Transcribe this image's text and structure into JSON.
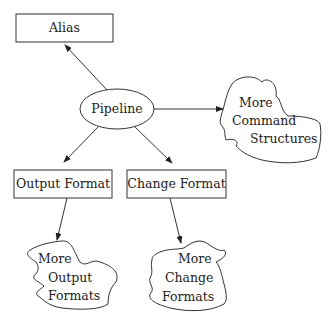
{
  "diagram": {
    "nodes": {
      "alias": {
        "label": "Alias",
        "shape": "rectangle"
      },
      "pipeline": {
        "label": "Pipeline",
        "shape": "ellipse"
      },
      "output_format": {
        "label": "Output Format",
        "shape": "rectangle"
      },
      "change_format": {
        "label": "Change Format",
        "shape": "rectangle"
      },
      "more_command_structures": {
        "lines": [
          "More",
          "Command",
          "Structures"
        ],
        "shape": "cloud"
      },
      "more_output_formats": {
        "lines": [
          "More",
          "Output",
          "Formats"
        ],
        "shape": "cloud"
      },
      "more_change_formats": {
        "lines": [
          "More",
          "Change",
          "Formats"
        ],
        "shape": "cloud"
      }
    },
    "edges": [
      {
        "from": "Pipeline",
        "to": "Alias"
      },
      {
        "from": "Pipeline",
        "to": "More Command Structures"
      },
      {
        "from": "Pipeline",
        "to": "Output Format"
      },
      {
        "from": "Pipeline",
        "to": "Change Format"
      },
      {
        "from": "Output Format",
        "to": "More Output Formats"
      },
      {
        "from": "Change Format",
        "to": "More Change Formats"
      }
    ]
  }
}
